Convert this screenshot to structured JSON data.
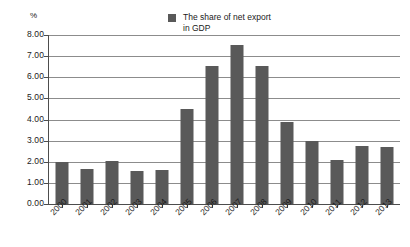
{
  "chart_data": {
    "type": "bar",
    "title": "",
    "xlabel": "",
    "ylabel": "%",
    "ylim": [
      0,
      8
    ],
    "ytick_step": 1,
    "ytick_labels": [
      "8.00",
      "7.00",
      "6.00",
      "5.00",
      "4.00",
      "3.00",
      "2.00",
      "1.00",
      "0.00"
    ],
    "grid": true,
    "legend_position": "top-center",
    "series": [
      {
        "name": "The share of net export in GDP",
        "color": "#595959",
        "values": [
          2.0,
          1.68,
          2.04,
          1.55,
          1.6,
          4.5,
          6.55,
          7.55,
          6.53,
          3.88,
          3.0,
          2.07,
          2.73,
          2.72
        ]
      }
    ],
    "categories": [
      "2000",
      "2001",
      "2002",
      "2003",
      "2004",
      "2005",
      "2006",
      "2007",
      "2008",
      "2009",
      "2010",
      "2011",
      "2012",
      "2013"
    ]
  },
  "legend": {
    "line1": "The share of net export",
    "line2": "in GDP"
  },
  "axis": {
    "y_unit": "%"
  },
  "colors": {
    "bar": "#595959",
    "gridline": "#8c8c8c",
    "axis": "#4d4d4d",
    "text": "#1a1a1a",
    "background": "#ffffff"
  }
}
